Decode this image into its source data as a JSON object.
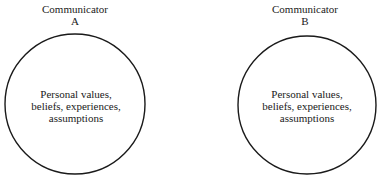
{
  "diagram": {
    "communicators": [
      {
        "title": "Communicator",
        "id_letter": "A",
        "inner_text": [
          "Personal values,",
          "beliefs, experiences,",
          "assumptions"
        ],
        "circle": {
          "cx": 75,
          "cy": 104,
          "r": 70
        }
      },
      {
        "title": "Communicator",
        "id_letter": "B",
        "inner_text": [
          "Personal values,",
          "beliefs, experiences,",
          "assumptions"
        ],
        "circle": {
          "cx": 307,
          "cy": 105,
          "r": 69
        }
      }
    ],
    "colors": {
      "stroke": "#1a1a1a",
      "text": "#1a1a1a",
      "background": "#ffffff"
    }
  }
}
